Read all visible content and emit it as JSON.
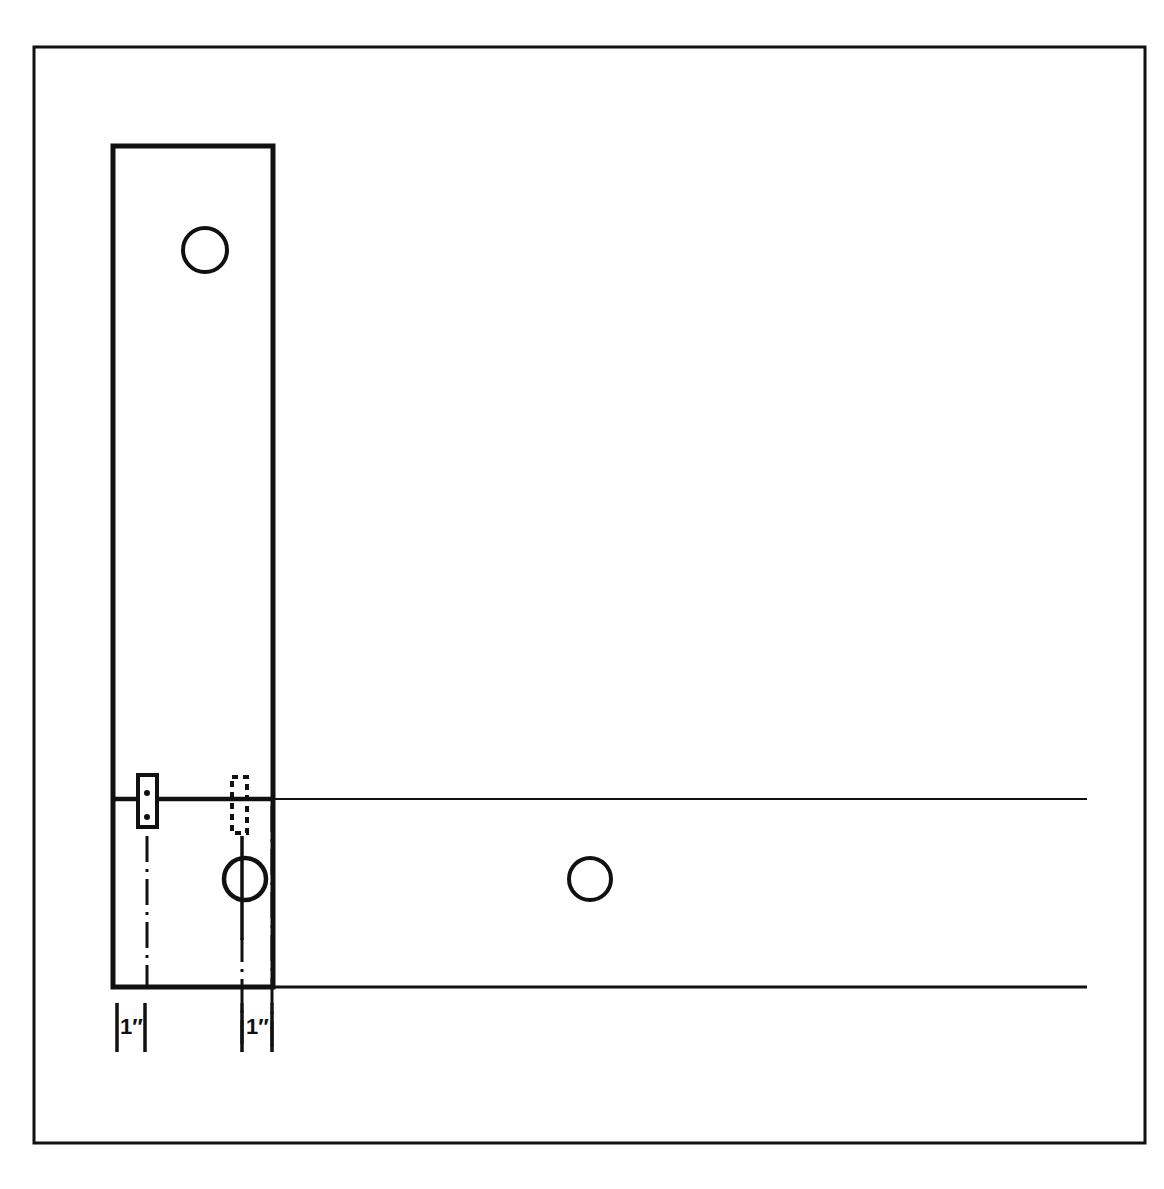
{
  "drawing": {
    "title": "Hand rail / post assembly detail drawing",
    "background_color": "#ffffff",
    "line_color": "#111111",
    "border": {
      "label": "drawing-frame",
      "x": 34,
      "y": 47,
      "width": 1111,
      "height": 1096,
      "stroke_width": 3
    },
    "post": {
      "label": "vertical-post",
      "x": 113,
      "y": 146,
      "width": 160,
      "height": 841,
      "stroke_width": 5
    },
    "rail": {
      "label": "horizontal-rail",
      "top_line_y": 799,
      "bottom_line_y": 987,
      "x_start": 113,
      "x_end": 1087,
      "stroke_width": 3
    },
    "hinge_plate": {
      "label": "hinge-plate",
      "x": 138,
      "y": 775,
      "width": 19,
      "height": 52,
      "stroke_width": 4,
      "fastener_dots": [
        {
          "cx": 147,
          "cy": 793,
          "r": 3
        },
        {
          "cx": 147,
          "cy": 817,
          "r": 3
        }
      ]
    },
    "hidden_slot": {
      "label": "hidden-mortise",
      "x": 232,
      "y": 777,
      "width": 15,
      "height": 56,
      "stroke_width": 4,
      "dash": "6 5"
    },
    "holes": [
      {
        "name": "upper-post-hole",
        "cx": 205,
        "cy": 250,
        "r": 22,
        "stroke_width": 4
      },
      {
        "name": "lower-post-hole",
        "cx": 245,
        "cy": 879,
        "r": 21,
        "stroke_width": 4
      },
      {
        "name": "rail-hole",
        "cx": 590,
        "cy": 879,
        "r": 21,
        "stroke_width": 4
      }
    ],
    "center_lines": [
      {
        "name": "centerline-plate",
        "x": 147,
        "y_start": 834,
        "y_end": 987
      },
      {
        "name": "centerline-slot",
        "x": 242,
        "y_start": 838,
        "y_end": 1050
      },
      {
        "name": "centerline-post-edge",
        "x": 272,
        "y_start": 808,
        "y_end": 1050
      }
    ],
    "solid_verticals": [
      {
        "name": "hole-axis-line",
        "x": 242,
        "y_start": 838,
        "y_end": 940
      }
    ],
    "dimensions": [
      {
        "name": "dimension-left",
        "label": "1″",
        "x_left": 117,
        "x_right": 145,
        "y_top": 1003,
        "y_bottom": 1052,
        "text_x": 122,
        "text_y": 1032
      },
      {
        "name": "dimension-right",
        "label": "1″",
        "x_left": 242,
        "x_right": 272,
        "y_top": 1003,
        "y_bottom": 1052,
        "text_x": 247,
        "text_y": 1032
      }
    ]
  }
}
